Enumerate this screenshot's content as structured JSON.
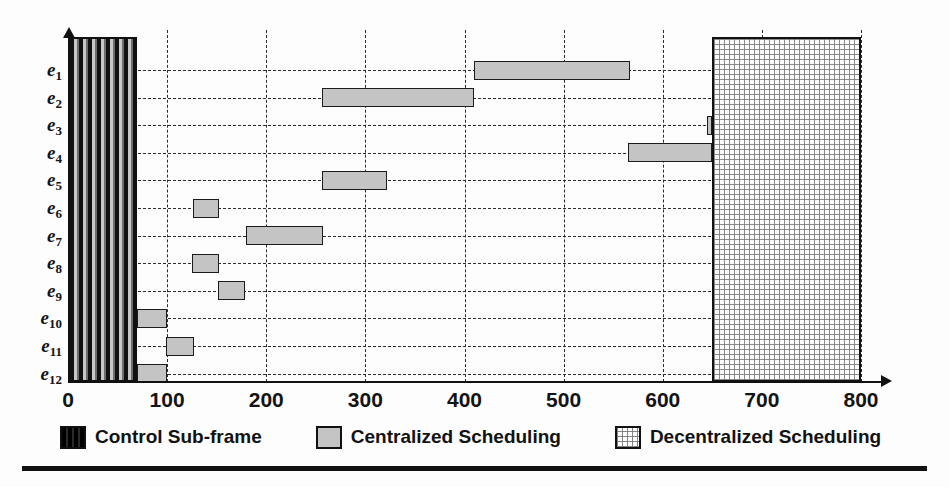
{
  "chart_data": {
    "type": "bar",
    "orientation": "horizontal",
    "title": "",
    "xlabel": "",
    "ylabel": "",
    "xlim": [
      0,
      800
    ],
    "xticks": [
      0,
      100,
      200,
      300,
      400,
      500,
      600,
      700,
      800
    ],
    "xtick_labels": [
      "0",
      "100",
      "200",
      "300",
      "400",
      "500",
      "600",
      "700",
      "800"
    ],
    "categories": [
      "e1",
      "e2",
      "e3",
      "e4",
      "e5",
      "e6",
      "e7",
      "e8",
      "e9",
      "e10",
      "e11",
      "e12"
    ],
    "category_labels": [
      "e",
      "e",
      "e",
      "e",
      "e",
      "e",
      "e",
      "e",
      "e",
      "e",
      "e",
      "e"
    ],
    "category_subscripts": [
      "1",
      "2",
      "3",
      "4",
      "5",
      "6",
      "7",
      "8",
      "9",
      "10",
      "11",
      "12"
    ],
    "grid": true,
    "grid_style": "dashed",
    "legend_position": "bottom",
    "legend": [
      {
        "label": "Control Sub-frame",
        "pattern": "vertical-stripes",
        "color": "#111111"
      },
      {
        "label": "Centralized Scheduling",
        "pattern": "solid-grey",
        "color": "#c4c4c4"
      },
      {
        "label": "Decentralized Scheduling",
        "pattern": "cross-hatch",
        "color": "#d8d8d8"
      }
    ],
    "regions": [
      {
        "name": "control-sub-frame",
        "start": 0,
        "end": 70,
        "series": "Control Sub-frame",
        "spans_all_rows": true
      },
      {
        "name": "decentralized-scheduling",
        "start": 650,
        "end": 800,
        "series": "Decentralized Scheduling",
        "spans_all_rows": true
      }
    ],
    "bars": [
      {
        "category": "e1",
        "start": 410,
        "end": 567,
        "duration": 157,
        "series": "Centralized Scheduling"
      },
      {
        "category": "e2",
        "start": 256,
        "end": 410,
        "duration": 154,
        "series": "Centralized Scheduling"
      },
      {
        "category": "e3",
        "start": 645,
        "end": 650,
        "duration": 5,
        "series": "Centralized Scheduling"
      },
      {
        "category": "e4",
        "start": 565,
        "end": 650,
        "duration": 85,
        "series": "Centralized Scheduling"
      },
      {
        "category": "e5",
        "start": 256,
        "end": 322,
        "duration": 66,
        "series": "Centralized Scheduling"
      },
      {
        "category": "e6",
        "start": 126,
        "end": 152,
        "duration": 26,
        "series": "Centralized Scheduling"
      },
      {
        "category": "e7",
        "start": 180,
        "end": 257,
        "duration": 77,
        "series": "Centralized Scheduling"
      },
      {
        "category": "e8",
        "start": 125,
        "end": 152,
        "duration": 27,
        "series": "Centralized Scheduling"
      },
      {
        "category": "e9",
        "start": 151,
        "end": 179,
        "duration": 28,
        "series": "Centralized Scheduling"
      },
      {
        "category": "e10",
        "start": 70,
        "end": 100,
        "duration": 30,
        "series": "Centralized Scheduling"
      },
      {
        "category": "e11",
        "start": 99,
        "end": 127,
        "duration": 28,
        "series": "Centralized Scheduling"
      },
      {
        "category": "e12",
        "start": 70,
        "end": 100,
        "duration": 30,
        "series": "Centralized Scheduling"
      }
    ]
  },
  "legend": {
    "items": [
      {
        "label": "Control Sub-frame"
      },
      {
        "label": "Centralized Scheduling"
      },
      {
        "label": "Decentralized Scheduling"
      }
    ]
  }
}
